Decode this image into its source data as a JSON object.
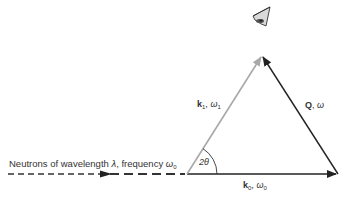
{
  "diagram": {
    "type": "scattering-triangle",
    "incoming_beam": {
      "label_prefix": "Neutrons of wavelength ",
      "lambda": "λ",
      "label_mid": ", frequency ",
      "omega": "ω",
      "omega_sub": "0",
      "style": "dashed"
    },
    "vectors": {
      "k0": {
        "symbol": "k",
        "sub": "0",
        "sep": ", ",
        "omega": "ω",
        "omega_sub": "0",
        "color": "#222222"
      },
      "k1": {
        "symbol": "k",
        "sub": "1",
        "sep": ", ",
        "omega": "ω",
        "omega_sub": "1",
        "color": "#a8a8a8"
      },
      "Q": {
        "symbol": "Q",
        "sep": ", ",
        "omega": "ω",
        "color": "#222222"
      }
    },
    "angle": {
      "label": "2θ"
    },
    "detector": {
      "icon": "detector-icon"
    }
  }
}
